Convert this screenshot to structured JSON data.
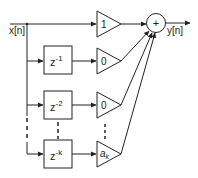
{
  "diagram": {
    "type": "block-diagram",
    "input_label": "x[n]",
    "output_label": "y[n]",
    "summer_symbol": "+",
    "delays": [
      {
        "label_base": "z",
        "label_exp": "-1"
      },
      {
        "label_base": "z",
        "label_exp": "-2"
      },
      {
        "label_base": "z",
        "label_exp": "-k"
      }
    ],
    "gains": [
      {
        "label": "1"
      },
      {
        "label": "0"
      },
      {
        "label": "0"
      },
      {
        "label_base": "a",
        "label_sub": "k"
      }
    ],
    "ellipsis": "⋮"
  },
  "colors": {
    "stroke": "#222222",
    "background": "#ffffff"
  }
}
